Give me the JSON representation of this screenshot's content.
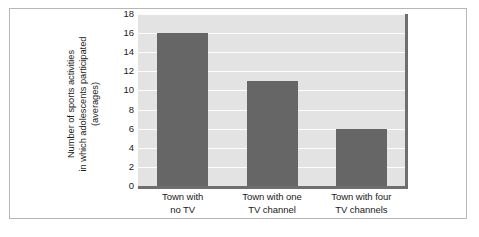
{
  "chart_data": {
    "type": "bar",
    "title": "",
    "xlabel": "",
    "ylabel": "Number of sports activities in which adolescents participated (averages)",
    "ylabel_lines": [
      "Number of sports activities",
      "in which adolescents participated",
      "(averages)"
    ],
    "categories": [
      "Town with no TV",
      "Town with one TV channel",
      "Town with four TV channels"
    ],
    "category_lines": [
      [
        "Town with",
        "no TV"
      ],
      [
        "Town with one",
        "TV channel"
      ],
      [
        "Town with four",
        "TV channels"
      ]
    ],
    "values": [
      16,
      11,
      6
    ],
    "ylim": [
      0,
      18
    ],
    "ytick_labels": [
      "0",
      "2",
      "4",
      "6",
      "8",
      "10",
      "12",
      "14",
      "16",
      "18"
    ],
    "ytick_values": [
      0,
      2,
      4,
      6,
      8,
      10,
      12,
      14,
      16,
      18
    ],
    "grid": true,
    "legend": false,
    "colors": {
      "bar": "#666666",
      "plot_background": "#e3e3e3",
      "gridline": "#fdfdfd",
      "axis_line": "#6e6e6e",
      "text": "#1b1b1b",
      "frame_border": "#b6b6b6",
      "page_background": "#ffffff"
    }
  }
}
